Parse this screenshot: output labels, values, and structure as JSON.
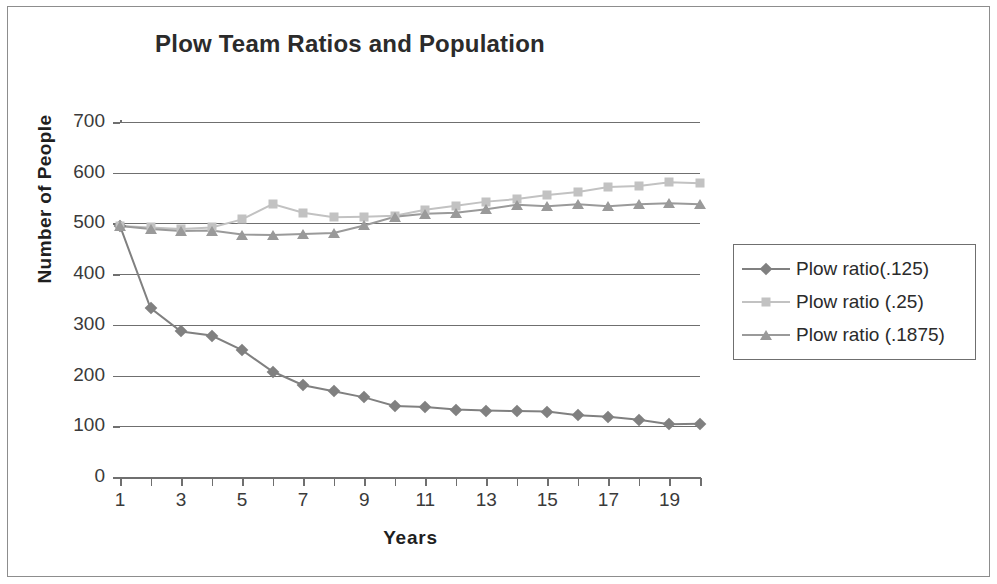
{
  "chart_data": {
    "type": "line",
    "title": "Plow Team Ratios and Population",
    "xlabel": "Years",
    "ylabel": "Number of People",
    "x": [
      1,
      2,
      3,
      4,
      5,
      6,
      7,
      8,
      9,
      10,
      11,
      12,
      13,
      14,
      15,
      16,
      17,
      18,
      19,
      20
    ],
    "xlim": [
      1,
      20
    ],
    "ylim": [
      0,
      700
    ],
    "y_ticks": [
      0,
      100,
      200,
      300,
      400,
      500,
      600,
      700
    ],
    "x_ticks": [
      1,
      3,
      5,
      7,
      9,
      11,
      13,
      15,
      17,
      19
    ],
    "x_tick_labels": [
      "1",
      "3",
      "5",
      "7",
      "9",
      "11",
      "13",
      "15",
      "17",
      "19"
    ],
    "y_tick_labels": [
      "0",
      "100",
      "200",
      "300",
      "400",
      "500",
      "600",
      "700"
    ],
    "grid": true,
    "legend_position": "right",
    "series": [
      {
        "name": "Plow ratio(.125)",
        "marker": "diamond",
        "color": "#808080",
        "values": [
          495,
          333,
          287,
          279,
          250,
          208,
          181,
          169,
          157,
          140,
          138,
          133,
          131,
          130,
          129,
          122,
          119,
          113,
          104,
          105
        ]
      },
      {
        "name": "Plow ratio (.25)",
        "marker": "square",
        "color": "#c2c2c2",
        "values": [
          495,
          492,
          489,
          492,
          508,
          538,
          521,
          512,
          513,
          515,
          527,
          535,
          543,
          548,
          556,
          562,
          572,
          574,
          581,
          579
        ]
      },
      {
        "name": "Plow ratio (.1875)",
        "marker": "triangle",
        "color": "#9a9a9a",
        "values": [
          495,
          489,
          485,
          486,
          478,
          477,
          479,
          481,
          496,
          513,
          519,
          521,
          528,
          537,
          534,
          538,
          534,
          538,
          540,
          538
        ]
      }
    ]
  },
  "legend": {
    "items": [
      {
        "label": "Plow ratio(.125)"
      },
      {
        "label": "Plow ratio (.25)"
      },
      {
        "label": "Plow ratio (.1875)"
      }
    ]
  },
  "colors": {
    "series1": "#808080",
    "series2": "#c2c2c2",
    "series3": "#9a9a9a",
    "axis": "#6f6f6f",
    "text": "#2b2b2b",
    "background": "#ffffff",
    "frame": "#8d8d8d"
  }
}
